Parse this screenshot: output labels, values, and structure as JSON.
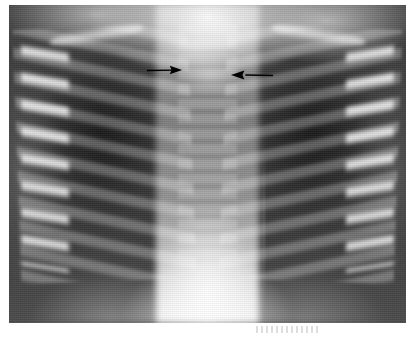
{
  "figure": {
    "kind": "radiograph",
    "modality": "chest-x-ray",
    "projection": "anteroposterior",
    "caption": "",
    "background_color": "#ffffff",
    "film_dark_tone": "#343434",
    "film_light_tone": "#ffffff",
    "annotation_color": "#000000"
  },
  "image_region": {
    "left": 9,
    "top": 5,
    "width": 397,
    "height": 318
  },
  "annotations": [
    {
      "id": "arrow-left",
      "name": "left-annotation-arrow",
      "shape": "arrow",
      "direction": "right",
      "color": "#000000",
      "tail_x": 146,
      "tail_y": 70,
      "tip_x": 184,
      "tip_y": 70,
      "points_at": "right-side-mediastinal-border"
    },
    {
      "id": "arrow-right",
      "name": "right-annotation-arrow",
      "shape": "arrow",
      "direction": "left",
      "color": "#000000",
      "tail_x": 274,
      "tail_y": 75,
      "tip_x": 230,
      "tip_y": 75,
      "points_at": "left-side-mediastinal-border"
    }
  ],
  "anatomy_labels": {
    "mediastinum": "mediastinum",
    "thymus": "thymic-shadow",
    "spine": "thoracic-vertebrae",
    "left_lung": "left-lung-field",
    "right_lung": "right-lung-field",
    "left_ribs": "left-rib-cage",
    "right_ribs": "right-rib-cage",
    "left_clavicle": "left-clavicle",
    "right_clavicle": "right-clavicle",
    "diaphragm": "diaphragm-and-upper-abdomen"
  },
  "artifacts": {
    "edge_smudge": "scan-edge-artifact",
    "scan_streak": "vertical-scan-streak",
    "grain": "film-grain"
  }
}
